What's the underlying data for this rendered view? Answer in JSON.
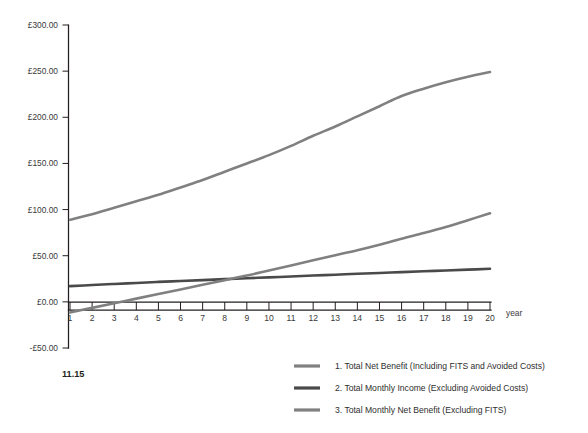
{
  "figure": {
    "caption": "11.15",
    "background_color": "#ffffff"
  },
  "chart_data": {
    "type": "line",
    "title": "",
    "subtitle": "",
    "xlabel": "year",
    "ylabel": "",
    "grid": false,
    "legend_position": "bottom-right",
    "xlim": [
      1,
      20
    ],
    "ylim": [
      -50,
      300
    ],
    "x": [
      1,
      2,
      3,
      4,
      5,
      6,
      7,
      8,
      9,
      10,
      11,
      12,
      13,
      14,
      15,
      16,
      17,
      18,
      19,
      20
    ],
    "xtick_labels": [
      "1",
      "2",
      "3",
      "4",
      "5",
      "6",
      "7",
      "8",
      "9",
      "10",
      "11",
      "12",
      "13",
      "14",
      "15",
      "16",
      "17",
      "18",
      "19",
      "20"
    ],
    "ytick_values": [
      -50,
      0,
      50,
      100,
      150,
      200,
      250,
      300
    ],
    "ytick_labels": [
      "-£50.00",
      "£0.00",
      "£50.00",
      "£100.00",
      "£150.00",
      "£200.00",
      "£250.00",
      "£300.00"
    ],
    "currency_symbol": "£",
    "series": [
      {
        "name": "1. Total Net Benefit (Including FITS and Avoided Costs)",
        "index": "1",
        "color": "#808080",
        "line_width": 2.6,
        "values": [
          89,
          95,
          102,
          109,
          116,
          124,
          132,
          141,
          150,
          159,
          169,
          180,
          190,
          201,
          212,
          223,
          231,
          238,
          244,
          249
        ]
      },
      {
        "name": "2. Total Monthly Income (Excluding Avoided Costs)",
        "index": "2",
        "color": "#4a4a4a",
        "line_width": 2.6,
        "values": [
          17,
          18.2,
          19.4,
          20.5,
          21.6,
          22.6,
          23.6,
          24.6,
          25.6,
          26.5,
          27.5,
          28.5,
          29.4,
          30.4,
          31.3,
          32.2,
          33.1,
          34.0,
          34.9,
          35.8
        ]
      },
      {
        "name": "3. Total Monthly Net Benefit (Excluding FITS)",
        "index": "3",
        "color": "#808080",
        "line_width": 2.6,
        "values": [
          -11.5,
          -6.5,
          -1.5,
          3.5,
          8.5,
          13.5,
          18.5,
          23.5,
          28.5,
          34,
          39.5,
          45,
          50.5,
          56,
          62,
          68.5,
          74.5,
          81,
          88.5,
          96
        ]
      }
    ]
  },
  "legend": {
    "items": [
      {
        "label": "1. Total Net Benefit (Including FITS and Avoided Costs)",
        "color": "#808080"
      },
      {
        "label": "2. Total Monthly Income (Excluding Avoided Costs)",
        "color": "#4a4a4a"
      },
      {
        "label": "3. Total Monthly Net Benefit (Excluding FITS)",
        "color": "#808080"
      }
    ]
  },
  "axis": {
    "x_axis_title": "year"
  }
}
